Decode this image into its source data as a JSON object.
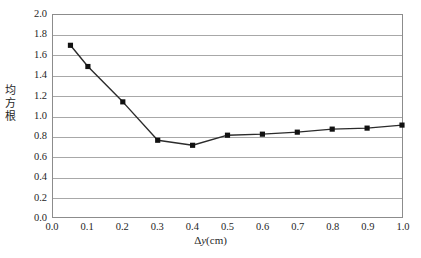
{
  "chart_data": {
    "type": "line",
    "title": "",
    "xlabel": "Δy(cm)",
    "ylabel": "均方根",
    "xlim": [
      0.0,
      1.0
    ],
    "ylim": [
      0.0,
      2.0
    ],
    "grid": "horizontal",
    "legend": "none",
    "marker": "filled-square",
    "line_color": "#2b2b2b",
    "marker_color": "#111111",
    "grid_color": "#a8a8a8",
    "x": [
      0.05,
      0.1,
      0.2,
      0.3,
      0.4,
      0.5,
      0.6,
      0.7,
      0.8,
      0.9,
      1.0
    ],
    "values": [
      1.7,
      1.49,
      1.14,
      0.76,
      0.71,
      0.81,
      0.82,
      0.84,
      0.87,
      0.88,
      0.91
    ],
    "series": [
      {
        "name": "均方根",
        "x": [
          0.05,
          0.1,
          0.2,
          0.3,
          0.4,
          0.5,
          0.6,
          0.7,
          0.8,
          0.9,
          1.0
        ],
        "values": [
          1.7,
          1.49,
          1.14,
          0.76,
          0.71,
          0.81,
          0.82,
          0.84,
          0.87,
          0.88,
          0.91
        ]
      }
    ],
    "xticks": [
      "0.0",
      "0.1",
      "0.2",
      "0.3",
      "0.4",
      "0.5",
      "0.6",
      "0.7",
      "0.8",
      "0.9",
      "1.0"
    ],
    "xtick_values": [
      0.0,
      0.1,
      0.2,
      0.3,
      0.4,
      0.5,
      0.6,
      0.7,
      0.8,
      0.9,
      1.0
    ],
    "yticks": [
      "0.0",
      "0.2",
      "0.4",
      "0.6",
      "0.8",
      "1.0",
      "1.2",
      "1.4",
      "1.6",
      "1.8",
      "2.0"
    ],
    "ytick_values": [
      0.0,
      0.2,
      0.4,
      0.6,
      0.8,
      1.0,
      1.2,
      1.4,
      1.6,
      1.8,
      2.0
    ]
  },
  "axis_titles": {
    "y_chars": [
      "均",
      "方",
      "根"
    ],
    "x_delta": "Δ",
    "x_var": "y",
    "x_unit": "(cm)"
  },
  "caption": {
    "sliver_text": ""
  }
}
